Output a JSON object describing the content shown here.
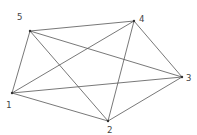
{
  "diagram": {
    "type": "complete-graph",
    "name": "K5",
    "nodes": [
      {
        "id": "1",
        "label": "1",
        "x": 12,
        "y": 93,
        "lx": 6,
        "ly": 108
      },
      {
        "id": "2",
        "label": "2",
        "x": 108,
        "y": 121,
        "lx": 107,
        "ly": 133
      },
      {
        "id": "3",
        "label": "3",
        "x": 182,
        "y": 77,
        "lx": 186,
        "ly": 81
      },
      {
        "id": "4",
        "label": "4",
        "x": 134,
        "y": 21,
        "lx": 139,
        "ly": 22
      },
      {
        "id": "5",
        "label": "5",
        "x": 30,
        "y": 31,
        "lx": 17,
        "ly": 20
      }
    ],
    "edges": [
      [
        "1",
        "2"
      ],
      [
        "1",
        "3"
      ],
      [
        "1",
        "4"
      ],
      [
        "1",
        "5"
      ],
      [
        "2",
        "3"
      ],
      [
        "2",
        "4"
      ],
      [
        "2",
        "5"
      ],
      [
        "3",
        "4"
      ],
      [
        "3",
        "5"
      ],
      [
        "4",
        "5"
      ]
    ],
    "colors": {
      "edge": "#555555",
      "node": "#333333",
      "label": "#444444",
      "background": "#ffffff"
    }
  }
}
